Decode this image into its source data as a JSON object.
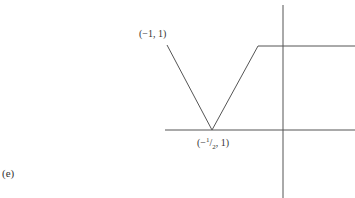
{
  "figure": {
    "panel_label": "(e)",
    "points": [
      {
        "label": "(−1, 1)"
      },
      {
        "label_prefix": "(−",
        "label_sup": "1",
        "label_slash": "/",
        "label_sub": "2",
        "label_suffix": ", 1)"
      }
    ],
    "colors": {
      "line": "#555555",
      "axis": "#555555",
      "text": "#333333"
    }
  }
}
